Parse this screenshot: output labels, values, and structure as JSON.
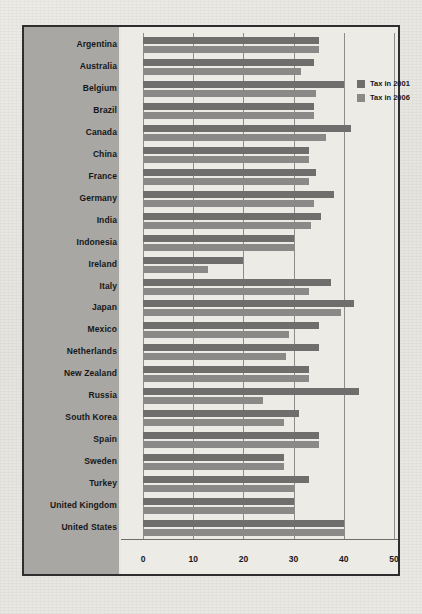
{
  "chart_data": {
    "type": "bar",
    "orientation": "horizontal",
    "title": "",
    "xlabel": "",
    "ylabel": "",
    "xlim": [
      0,
      50
    ],
    "xticks": [
      0,
      10,
      20,
      30,
      40,
      50
    ],
    "xtick_labels": [
      "0",
      "10",
      "20",
      "30",
      "40",
      "50"
    ],
    "grid": true,
    "legend_position": "top-right",
    "categories": [
      "Argentina",
      "Australia",
      "Belgium",
      "Brazil",
      "Canada",
      "China",
      "France",
      "Germany",
      "India",
      "Indonesia",
      "Ireland",
      "Italy",
      "Japan",
      "Mexico",
      "Netherlands",
      "New Zealand",
      "Russia",
      "South Korea",
      "Spain",
      "Sweden",
      "Turkey",
      "United Kingdom",
      "United States"
    ],
    "series": [
      {
        "name": "Tax in 2001",
        "color": "#6f6e6c",
        "values": [
          35,
          34,
          40,
          34,
          41.5,
          33,
          34.5,
          38,
          35.5,
          30,
          20,
          37.5,
          42,
          35,
          35,
          33,
          43,
          31,
          35,
          28,
          33,
          30,
          40
        ]
      },
      {
        "name": "Tax in 2006",
        "color": "#8a8987",
        "values": [
          35,
          31.5,
          34.5,
          34,
          36.5,
          33,
          33,
          34,
          33.5,
          30,
          13,
          33,
          39.5,
          29,
          28.5,
          33,
          24,
          28,
          35,
          28,
          30,
          30,
          40
        ]
      }
    ]
  },
  "legend": {
    "items": [
      {
        "label": "Tax in 2001"
      },
      {
        "label": "Tax in 2006"
      }
    ]
  },
  "colors": {
    "series_2001": "#6f6e6c",
    "series_2006": "#8a8987",
    "label_panel": "#a8a7a3",
    "plot_background": "#edebe6",
    "frame_border": "#2e2e2e"
  }
}
